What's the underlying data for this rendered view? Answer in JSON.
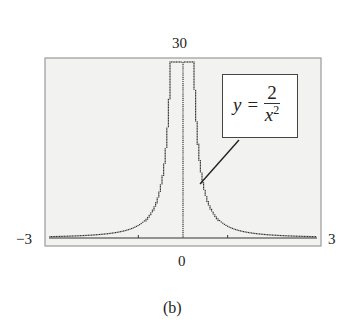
{
  "caption": "(b)",
  "labels": {
    "ymax": "30",
    "ymin": "0",
    "xmin": "−3",
    "xmax": "3"
  },
  "equation": {
    "lhs": "y",
    "eq": "=",
    "numerator": "2",
    "den_base": "x",
    "den_exp": "2"
  },
  "colors": {
    "screen_bg": "#f2f2f0",
    "frame": "#999999",
    "plot": "#333333"
  },
  "chart_data": {
    "type": "line",
    "title": "",
    "function": "y = 2/x^2",
    "xlabel": "",
    "ylabel": "",
    "xlim": [
      -3,
      3
    ],
    "ylim": [
      0,
      30
    ],
    "x_tick_labels": [
      "-3",
      "3"
    ],
    "y_tick_labels": [
      "0",
      "30"
    ],
    "x_ticks": [
      -1,
      1
    ],
    "grid": false,
    "annotation": "y = 2/x^2",
    "x": [
      -3,
      -2.5,
      -2,
      -1.5,
      -1,
      -0.75,
      -0.5,
      -0.4,
      -0.3,
      -0.26,
      0.26,
      0.3,
      0.4,
      0.5,
      0.75,
      1,
      1.5,
      2,
      2.5,
      3
    ],
    "y": [
      0.22,
      0.32,
      0.5,
      0.89,
      2,
      3.56,
      8,
      12.5,
      22.2,
      29.6,
      29.6,
      22.2,
      12.5,
      8,
      3.56,
      2,
      0.89,
      0.5,
      0.32,
      0.22
    ],
    "caption": "(b)"
  }
}
